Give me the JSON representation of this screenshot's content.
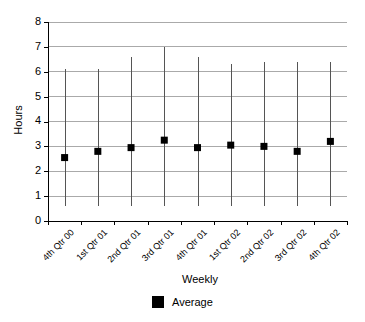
{
  "chart_data": {
    "type": "scatter",
    "title": "",
    "xlabel": "Weekly",
    "ylabel": "Hours",
    "ylim": [
      0,
      8
    ],
    "yticks": [
      0,
      1,
      2,
      3,
      4,
      5,
      6,
      7,
      8
    ],
    "grid": true,
    "legend_position": "bottom",
    "categories": [
      "4th Qtr 00",
      "1st Qtr 01",
      "2nd Qtr 01",
      "3rd Qtr 01",
      "4th Qtr 01",
      "1st Qtr 02",
      "2nd Qtr 02",
      "3rd Qtr 02",
      "4th Qtr 02"
    ],
    "series": [
      {
        "name": "Average",
        "marker": "square",
        "color": "#000000",
        "values": [
          2.55,
          2.8,
          2.95,
          3.25,
          2.95,
          3.05,
          3.0,
          2.8,
          3.2
        ]
      }
    ],
    "range_bars": {
      "name": "Range",
      "color": "#555555",
      "high": [
        6.1,
        6.1,
        6.6,
        7.0,
        6.6,
        6.3,
        6.4,
        6.4,
        6.4
      ],
      "low": [
        0.6,
        0.6,
        0.6,
        0.6,
        0.6,
        0.6,
        0.6,
        0.6,
        0.6
      ]
    }
  },
  "legend": {
    "entries": [
      {
        "label": "Average",
        "color": "#000000",
        "marker": "square"
      }
    ]
  }
}
